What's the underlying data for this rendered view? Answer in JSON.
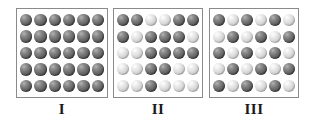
{
  "figure": {
    "caption": "",
    "grid": {
      "columns": 6,
      "rows": 5
    },
    "legend": {
      "dark_label": "dark sphere",
      "light_label": "light sphere"
    },
    "colors": {
      "dark_sphere": "#6d6d6d",
      "light_sphere": "#d8d8d8",
      "box_border": "#8a8a8a",
      "background": "#ffffff",
      "label_text": "#1a1a1a"
    }
  },
  "panels": [
    {
      "label": "I",
      "description": "uniform dark spheres",
      "rows": [
        [
          "dark",
          "dark",
          "dark",
          "dark",
          "dark",
          "dark"
        ],
        [
          "dark",
          "dark",
          "dark",
          "dark",
          "dark",
          "dark"
        ],
        [
          "dark",
          "dark",
          "dark",
          "dark",
          "dark",
          "dark"
        ],
        [
          "dark",
          "dark",
          "dark",
          "dark",
          "dark",
          "dark"
        ],
        [
          "dark",
          "dark",
          "dark",
          "dark",
          "dark",
          "dark"
        ]
      ],
      "counts": {
        "dark": 30,
        "light": 0,
        "total": 30
      }
    },
    {
      "label": "II",
      "description": "random mixture of dark and light spheres",
      "rows": [
        [
          "dark",
          "dark",
          "light",
          "light",
          "dark",
          "dark"
        ],
        [
          "dark",
          "light",
          "dark",
          "dark",
          "dark",
          "light"
        ],
        [
          "light",
          "light",
          "dark",
          "dark",
          "dark",
          "dark"
        ],
        [
          "light",
          "light",
          "dark",
          "dark",
          "light",
          "light"
        ],
        [
          "light",
          "light",
          "dark",
          "light",
          "light",
          "light"
        ]
      ],
      "counts": {
        "dark": 16,
        "light": 14,
        "total": 30
      }
    },
    {
      "label": "III",
      "description": "alternating checkerboard of dark and light spheres",
      "rows": [
        [
          "dark",
          "light",
          "dark",
          "light",
          "dark",
          "light"
        ],
        [
          "light",
          "dark",
          "light",
          "dark",
          "light",
          "dark"
        ],
        [
          "dark",
          "light",
          "dark",
          "light",
          "dark",
          "light"
        ],
        [
          "light",
          "dark",
          "light",
          "dark",
          "light",
          "dark"
        ],
        [
          "dark",
          "light",
          "dark",
          "light",
          "dark",
          "light"
        ]
      ],
      "counts": {
        "dark": 15,
        "light": 15,
        "total": 30
      }
    }
  ]
}
